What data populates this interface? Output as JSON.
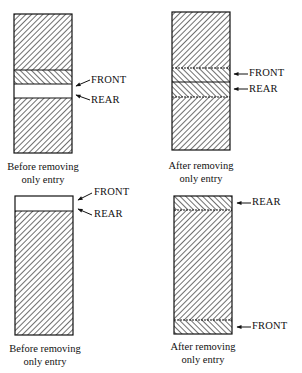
{
  "panels": [
    {
      "id": "top-left",
      "caption": [
        "Before removing",
        "only entry"
      ],
      "labels": [
        {
          "text": "FRONT"
        },
        {
          "text": "REAR"
        }
      ]
    },
    {
      "id": "top-right",
      "caption": [
        "After removing",
        "only entry"
      ],
      "labels": [
        {
          "text": "FRONT"
        },
        {
          "text": "REAR"
        }
      ]
    },
    {
      "id": "bottom-left",
      "caption": [
        "Before removing",
        "only entry"
      ],
      "labels": [
        {
          "text": "FRONT"
        },
        {
          "text": "REAR"
        }
      ]
    },
    {
      "id": "bottom-right",
      "caption": [
        "After removing",
        "only entry"
      ],
      "labels": [
        {
          "text": "REAR"
        },
        {
          "text": "FRONT"
        }
      ]
    }
  ]
}
